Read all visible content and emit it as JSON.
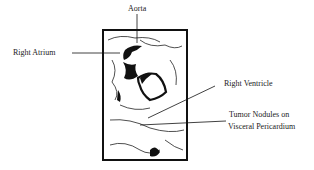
{
  "figure": {
    "labels": {
      "aorta": "Aorta",
      "right_atrium": "Right Atrium",
      "right_ventricle": "Right Ventricle",
      "tumor_line1": "Tumor Nodules on",
      "tumor_line2": "Visceral Pericardium"
    },
    "colors": {
      "ink": "#111111",
      "background": "#ffffff"
    }
  }
}
